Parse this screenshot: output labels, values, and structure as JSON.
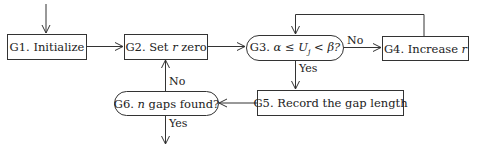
{
  "diagram": {
    "type": "flowchart",
    "nodes": [
      {
        "id": "G1",
        "label": "G1. Initialize",
        "shape": "rectangle"
      },
      {
        "id": "G2",
        "label_pre": "G2. Set ",
        "label_var": "r",
        "label_post": " zero",
        "shape": "rectangle"
      },
      {
        "id": "G3",
        "label_pre": "G3.  ",
        "label_var": "α ≤ U",
        "label_sub": "j",
        "label_post": " < β?",
        "shape": "rounded"
      },
      {
        "id": "G4",
        "label_pre": "G4. Increase ",
        "label_var": "r",
        "shape": "rectangle"
      },
      {
        "id": "G5",
        "label": "G5. Record the gap length",
        "shape": "rectangle"
      },
      {
        "id": "G6",
        "label_pre": "G6. ",
        "label_var": "n",
        "label_post": " gaps found?",
        "shape": "rounded"
      }
    ],
    "edges": [
      {
        "from": "start",
        "to": "G1",
        "label": ""
      },
      {
        "from": "G1",
        "to": "G2",
        "label": ""
      },
      {
        "from": "G2",
        "to": "G3",
        "label": ""
      },
      {
        "from": "G3",
        "to": "G4",
        "label": "No"
      },
      {
        "from": "G4",
        "to": "G3",
        "label": ""
      },
      {
        "from": "G3",
        "to": "G5",
        "label": "Yes"
      },
      {
        "from": "G5",
        "to": "G6",
        "label": ""
      },
      {
        "from": "G6",
        "to": "G2",
        "label": "No"
      },
      {
        "from": "G6",
        "to": "end",
        "label": "Yes"
      }
    ],
    "edge_labels": {
      "g3_no": "No",
      "g3_yes": "Yes",
      "g6_no": "No",
      "g6_yes": "Yes"
    }
  }
}
